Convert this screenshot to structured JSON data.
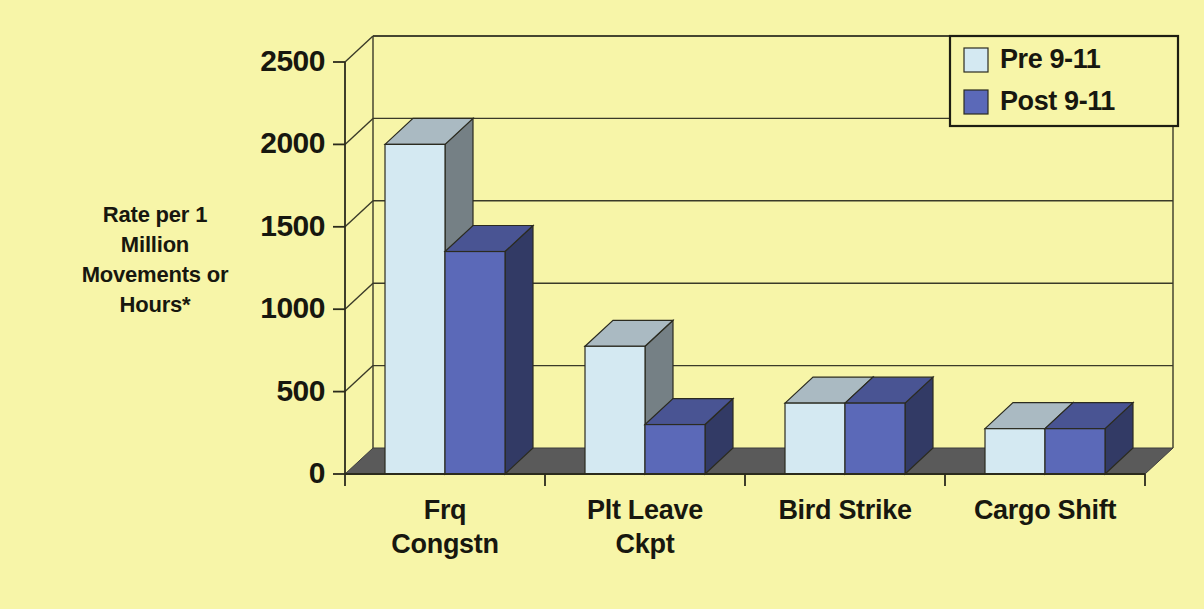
{
  "chart_data": {
    "type": "bar",
    "title": "",
    "subtitle": "",
    "xlabel": "",
    "ylabel": "Rate per 1 Million Movements or Hours*",
    "ylabel_lines": [
      "Rate per 1",
      "Million",
      "Movements or",
      "Hours*"
    ],
    "categories": [
      "Frq Congstn",
      "Plt Leave Ckpt",
      "Bird Strike",
      "Cargo Shift"
    ],
    "category_lines": [
      [
        "Frq",
        "Congstn"
      ],
      [
        "Plt Leave",
        "Ckpt"
      ],
      [
        "Bird Strike"
      ],
      [
        "Cargo Shift"
      ]
    ],
    "series": [
      {
        "name": "Pre 9-11",
        "color": "#d4e9f2",
        "values": [
          2000,
          775,
          430,
          275
        ]
      },
      {
        "name": "Post 9-11",
        "color": "#5b69b8",
        "values": [
          1350,
          300,
          430,
          275
        ]
      }
    ],
    "yticks": [
      0,
      500,
      1000,
      1500,
      2000,
      2500
    ],
    "ytick_labels": [
      "0",
      "500",
      "1000",
      "1500",
      "2000",
      "2500"
    ],
    "ylim": [
      0,
      2500
    ],
    "grid": true,
    "grid_axis": "y",
    "legend_position": "top-right",
    "style": "3d-clustered-column",
    "background_color": "#f7f5a8",
    "floor_color": "#5a5a5a",
    "axis_color": "#2b2b1c"
  },
  "legend": {
    "entries": [
      {
        "label": "Pre 9-11",
        "color": "#d4e9f2"
      },
      {
        "label": "Post 9-11",
        "color": "#5b69b8"
      }
    ]
  }
}
